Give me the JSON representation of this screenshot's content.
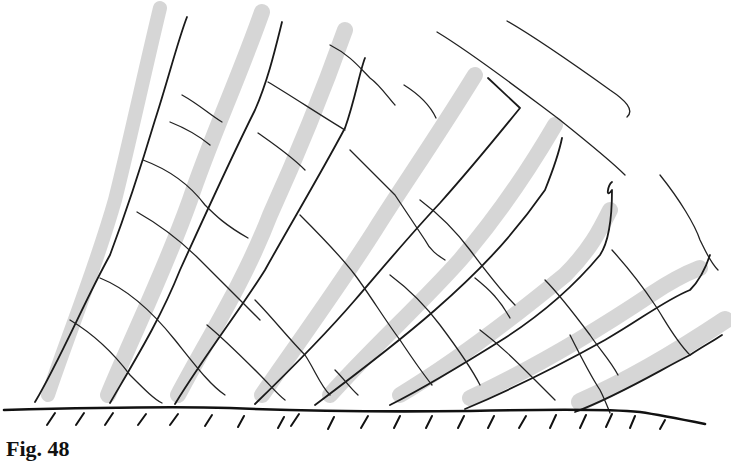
{
  "figure": {
    "caption": "Fig. 48",
    "colors": {
      "ink": "#1a1a1a",
      "shading": "#d4d4d4",
      "background": "#ffffff"
    }
  },
  "shaded_bands": [
    {
      "w": 14,
      "d": "M48,395 C70,330 95,270 115,200 C130,140 145,70 160,8"
    },
    {
      "w": 16,
      "d": "M108,395 C135,330 165,270 190,200 C210,140 238,80 262,12"
    },
    {
      "w": 16,
      "d": "M178,395 C210,335 245,280 270,215 C295,160 320,100 345,30"
    },
    {
      "w": 16,
      "d": "M262,395 C300,340 340,285 375,230 C400,190 435,140 475,75"
    },
    {
      "w": 16,
      "d": "M330,395 C370,350 420,305 460,260 C490,225 520,185 555,125"
    },
    {
      "w": 16,
      "d": "M400,395 C450,365 510,320 565,275 C590,250 600,230 610,210"
    },
    {
      "w": 16,
      "d": "M470,398 C530,370 590,335 650,295 C680,275 695,270 700,268"
    },
    {
      "w": 18,
      "d": "M580,402 C630,380 680,350 725,320"
    }
  ],
  "lines_family_a": [
    "M35,402 C60,360 85,300 110,255 C125,215 140,170 155,120 C168,80 178,40 187,17",
    "M110,403 C135,360 160,320 180,270 C205,215 230,160 255,110 C268,80 275,50 282,22",
    "M175,404 C205,355 240,310 265,270 C290,225 320,175 345,128 C355,100 360,70 365,58",
    "M255,404 C290,370 325,335 355,300 C385,265 410,235 440,203 C465,175 490,145 520,108 L488,78",
    "M315,405 C355,375 395,345 435,310 C475,275 510,240 545,190 C555,165 560,148 562,138",
    "M390,405 C430,385 470,360 505,338 C545,312 575,285 600,255 C610,240 612,210 612,190 C605,200 608,185 612,182",
    "M465,409 C510,390 560,365 605,340 C640,320 665,300 690,290 C700,280 705,270 710,255",
    "M575,412 C620,395 660,370 690,355 C705,345 715,340 722,335"
  ],
  "lines_family_b": [
    "M182,95 C200,105 210,115 222,122",
    "M143,160 C170,170 190,185 205,205 C215,215 225,225 248,238",
    "M170,122 C185,128 198,135 210,145",
    "M268,82 C290,95 320,115 345,130",
    "M258,133 C275,145 290,155 305,170",
    "M330,45 C350,55 360,68 370,78 C380,85 390,100 395,105",
    "M404,85 C420,95 430,105 436,118",
    "M437,32 C475,55 520,90 560,120 C585,140 610,160 625,175",
    "M507,21 C540,40 575,65 610,90 C625,100 635,110 627,117",
    "M660,175 C680,200 695,225 700,240 C705,250 710,262 718,270",
    "M137,212 C160,225 180,240 200,260 C220,280 240,300 260,320",
    "M100,278 C130,290 155,315 175,340 C195,365 210,385 225,395",
    "M70,320 C95,335 115,355 130,375 C145,390 155,400 162,403",
    "M350,150 C365,165 380,180 395,195 C405,210 415,225 425,240 C430,250 437,255 445,260",
    "M390,275 C410,290 425,305 440,325 C455,345 470,365 480,385",
    "M420,200 C440,215 455,230 470,250 C485,270 500,290 515,305",
    "M475,278 C490,290 500,300 510,318",
    "M545,280 C560,295 575,315 590,335 C600,350 610,360 618,375",
    "M480,330 C500,345 515,360 535,380 C545,390 550,395 555,400",
    "M570,335 C580,355 590,375 600,390 C605,400 608,408 610,413",
    "M612,250 C630,270 645,290 655,305 C665,320 675,340 690,355",
    "M255,300 C270,315 290,340 305,355 C315,370 320,385 330,395",
    "M300,215 C320,235 340,255 355,275 C370,295 385,320 400,340 C410,355 420,370 432,385",
    "M207,325 C225,340 245,360 260,375 C270,385 278,395 285,400",
    "M335,370 C345,380 350,388 358,395"
  ],
  "ground": {
    "surface": "M4,410 C80,408 160,406 230,408 C300,411 380,412 470,411 C560,409 620,410 640,412 C660,415 690,421 705,424",
    "hatches": [
      [
        55,
        413,
        47,
        425
      ],
      [
        84,
        413,
        76,
        425
      ],
      [
        113,
        413,
        105,
        425
      ],
      [
        146,
        414,
        138,
        425
      ],
      [
        178,
        414,
        170,
        425
      ],
      [
        212,
        415,
        205,
        426
      ],
      [
        244,
        416,
        238,
        427
      ],
      [
        284,
        417,
        278,
        428
      ],
      [
        299,
        414,
        291,
        426
      ],
      [
        334,
        417,
        328,
        429
      ],
      [
        368,
        416,
        361,
        428
      ],
      [
        400,
        416,
        394,
        428
      ],
      [
        432,
        416,
        426,
        428
      ],
      [
        464,
        416,
        458,
        428
      ],
      [
        494,
        416,
        488,
        428
      ],
      [
        526,
        416,
        519,
        428
      ],
      [
        556,
        415,
        550,
        428
      ],
      [
        586,
        415,
        580,
        428
      ],
      [
        612,
        414,
        606,
        427
      ],
      [
        635,
        416,
        630,
        428
      ],
      [
        665,
        420,
        660,
        429
      ]
    ]
  }
}
